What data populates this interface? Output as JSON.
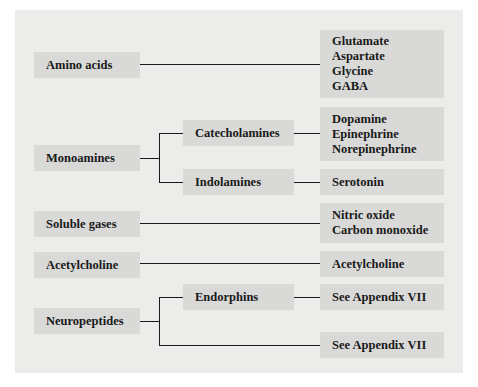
{
  "diagram": {
    "categories": [
      {
        "label": "Amino acids",
        "members": [
          "Glutamate",
          "Aspartate",
          "Glycine",
          "GABA"
        ]
      },
      {
        "label": "Monoamines",
        "subcategories": [
          {
            "label": "Catecholamines",
            "members": [
              "Dopamine",
              "Epinephrine",
              "Norepinephrine"
            ]
          },
          {
            "label": "Indolamines",
            "members": [
              "Serotonin"
            ]
          }
        ]
      },
      {
        "label": "Soluble gases",
        "members": [
          "Nitric oxide",
          "Carbon monoxide"
        ]
      },
      {
        "label": "Acetylcholine",
        "members": [
          "Acetylcholine"
        ]
      },
      {
        "label": "Neuropeptides",
        "subcategories": [
          {
            "label": "Endorphins",
            "members": [
              "See Appendix VII"
            ]
          }
        ],
        "other": [
          "See Appendix VII"
        ]
      }
    ]
  }
}
